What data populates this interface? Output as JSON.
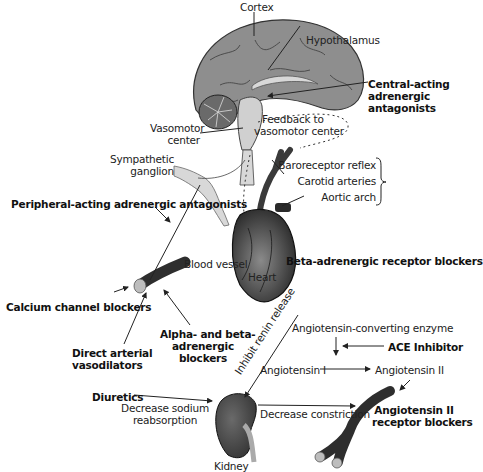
{
  "diagram": {
    "anatomy_labels": {
      "cortex": "Cortex",
      "hypothalamus": "Hypothalamus",
      "vasomotor_center": [
        "Vasomotor",
        "center"
      ],
      "feedback": [
        "Feedback to",
        "vasomotor center"
      ],
      "sympathetic_ganglion": [
        "Sympathetic",
        "ganglion"
      ],
      "baroreceptor": [
        "Baroreceptor reflex",
        "Carotid arteries",
        "Aortic arch"
      ],
      "blood_vessel": "Blood vessel",
      "heart": "Heart",
      "kidney": "Kidney"
    },
    "drug_classes": {
      "central_acting": [
        "Central-acting",
        "adrenergic",
        "antagonists"
      ],
      "peripheral_acting": "Peripheral-acting adrenergic antagonists",
      "beta_blockers": "Beta-adrenergic receptor blockers",
      "calcium_channel": "Calcium channel blockers",
      "direct_vasodilators": [
        "Direct arterial",
        "vasodilators"
      ],
      "alpha_beta": [
        "Alpha- and beta-",
        "adrenergic",
        "blockers"
      ],
      "ace_inhibitor": "ACE Inhibitor",
      "arb": [
        "Angiotensin II",
        "receptor blockers"
      ],
      "diuretics": "Diuretics"
    },
    "process_labels": {
      "inhibit_renin": "Inhibit renin release",
      "ace_enzyme": "Angiotensin-converting enzyme",
      "angiotensin_1": "Angiotensin I",
      "angiotensin_2": "Angiotensin II",
      "decrease_constriction": "Decrease constriction",
      "decrease_sodium": [
        "Decrease sodium",
        "reabsorption"
      ]
    },
    "colors": {
      "brain_fill": "#8e8e8e",
      "brain_inner": "#c8c8c8",
      "organ_dark": "#3a3a3a",
      "vessel_dark": "#2e2e2e",
      "nerve_fill": "#d8d8d8",
      "line": "#222222",
      "background": "#ffffff"
    }
  }
}
